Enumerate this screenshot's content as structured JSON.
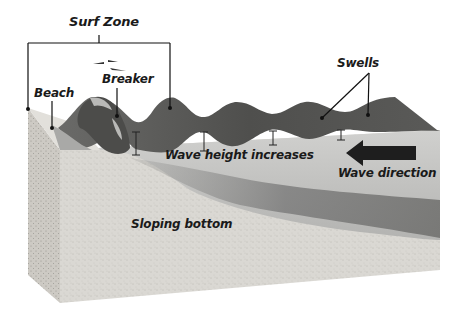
{
  "diagram": {
    "type": "cross-section",
    "labels": {
      "surf_zone": "Surf Zone",
      "beach": "Beach",
      "breaker": "Breaker",
      "swells": "Swells",
      "wave_height": "Wave height increases",
      "wave_direction": "Wave direction",
      "sloping_bottom": "Sloping bottom"
    },
    "colors": {
      "sand": "#d9d7d2",
      "sand_side": "#cfccc6",
      "water_cross_section": "#c4c4c2",
      "water_surface": "#5d5d5b",
      "water_dark": "#3e3e3c",
      "bottom_shadow": "#8d8d8b",
      "ink": "#111111",
      "arrow": "#1e1e1e"
    }
  }
}
